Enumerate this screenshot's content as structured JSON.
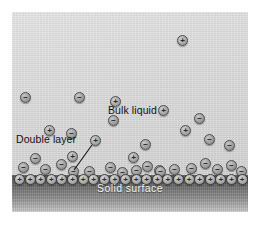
{
  "figure": {
    "background_color": "#ffffff"
  },
  "labels": {
    "bulk_liquid": "Bulk liquid",
    "double_layer": "Double layer",
    "solid_surface": "Solid surface"
  },
  "signs": {
    "positive": "+",
    "negative": "−"
  },
  "colors": {
    "liquid_top": "#e4e4e4",
    "liquid_bottom": "#d2d2d2",
    "solid_top": "#565656",
    "solid_bottom": "#d2d2d2",
    "ion_outline": "#4c4c4c",
    "solid_label_text": "#f2f2f2",
    "label_text": "#111111"
  },
  "chart_data": {
    "type": "scatter",
    "xlabel": "",
    "ylabel": "",
    "xlim": [
      0,
      236
    ],
    "ylim": [
      0,
      200
    ],
    "grid": false,
    "legend": "none",
    "annotations": [
      {
        "text": "Bulk liquid",
        "x": 96,
        "y": 92
      },
      {
        "text": "Double layer",
        "x": 4,
        "y": 121
      },
      {
        "text": "Solid surface",
        "x": 118,
        "y": 170
      }
    ],
    "regions": [
      {
        "name": "liquid",
        "y_top": 0,
        "y_bottom": 163,
        "fill": "#dadada"
      },
      {
        "name": "solid",
        "y_top": 163,
        "y_bottom": 200,
        "fill": "#6e6e6e"
      }
    ],
    "series": [
      {
        "name": "free cations",
        "charge": "+",
        "size": 11,
        "points": [
          {
            "x": 165,
            "y": 23
          },
          {
            "x": 98,
            "y": 84
          },
          {
            "x": 146,
            "y": 93
          },
          {
            "x": 32,
            "y": 113
          },
          {
            "x": 168,
            "y": 113
          },
          {
            "x": 78,
            "y": 123
          },
          {
            "x": 55,
            "y": 139
          },
          {
            "x": 116,
            "y": 140
          },
          {
            "x": 142,
            "y": 153
          }
        ]
      },
      {
        "name": "free anions",
        "charge": "−",
        "size": 11,
        "points": [
          {
            "x": 8,
            "y": 80
          },
          {
            "x": 62,
            "y": 80
          },
          {
            "x": 96,
            "y": 103
          },
          {
            "x": 182,
            "y": 101
          },
          {
            "x": 54,
            "y": 116
          },
          {
            "x": 192,
            "y": 122
          },
          {
            "x": 128,
            "y": 127
          },
          {
            "x": 212,
            "y": 128
          }
        ]
      },
      {
        "name": "double layer anions",
        "charge": "−",
        "size": 11,
        "points": [
          {
            "x": 6,
            "y": 150
          },
          {
            "x": 18,
            "y": 141
          },
          {
            "x": 28,
            "y": 152
          },
          {
            "x": 44,
            "y": 147
          },
          {
            "x": 56,
            "y": 154
          },
          {
            "x": 72,
            "y": 154
          },
          {
            "x": 93,
            "y": 150
          },
          {
            "x": 105,
            "y": 155
          },
          {
            "x": 119,
            "y": 153
          },
          {
            "x": 130,
            "y": 149
          },
          {
            "x": 143,
            "y": 154
          },
          {
            "x": 157,
            "y": 152
          },
          {
            "x": 174,
            "y": 151
          },
          {
            "x": 188,
            "y": 146
          },
          {
            "x": 200,
            "y": 152
          },
          {
            "x": 214,
            "y": 148
          },
          {
            "x": 224,
            "y": 154
          }
        ]
      },
      {
        "name": "bound surface cations",
        "charge": "+",
        "size": 11,
        "count": 22,
        "y": 162,
        "x_start": 2,
        "x_step": 10.6
      }
    ]
  }
}
